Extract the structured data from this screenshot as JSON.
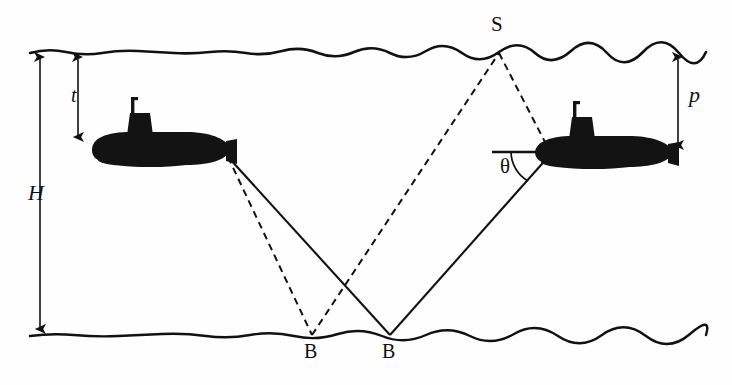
{
  "figure": {
    "domain": "physics-diagram",
    "background_color": "#fefefe",
    "ink_color": "#111111"
  },
  "labels": {
    "depth_total": "H",
    "depth_own_sub": "t",
    "depth_target_sub": "p",
    "surface_point": "S",
    "bottom_point_1": "B",
    "bottom_point_2": "B",
    "angle": "θ"
  },
  "boundaries": {
    "sea_surface": {
      "name": "sea-surface",
      "y": 52,
      "x_start": 30,
      "x_end": 706,
      "style": "wavy"
    },
    "sea_bottom": {
      "name": "sea-bottom",
      "y": 335,
      "x_start": 30,
      "x_end": 706,
      "style": "wavy"
    }
  },
  "dimension_arrows": [
    {
      "name": "H",
      "label": "H",
      "x": 40,
      "y_top": 52,
      "y_bottom": 333,
      "heads": "both",
      "label_x": 30,
      "label_y": 185
    },
    {
      "name": "t",
      "label": "t",
      "x": 78,
      "y_top": 52,
      "y_bottom": 141,
      "heads": "both",
      "label_x": 70,
      "label_y": 86
    },
    {
      "name": "p",
      "label": "p",
      "x": 678,
      "y_top": 52,
      "y_bottom": 149,
      "heads": "both",
      "label_x": 688,
      "label_y": 86
    }
  ],
  "nodes": {
    "S": {
      "label": "S",
      "x": 499,
      "y": 52,
      "label_x": 491,
      "label_y": 16
    },
    "B1": {
      "label": "B",
      "x": 312,
      "y": 335,
      "label_x": 304,
      "label_y": 341
    },
    "B2": {
      "label": "B",
      "x": 390,
      "y": 335,
      "label_x": 382,
      "label_y": 341
    }
  },
  "submarines": [
    {
      "name": "own-submarine",
      "side": "left",
      "facing": "right",
      "hull": {
        "x": 92,
        "y": 134,
        "width": 140,
        "height": 30
      },
      "tower": {
        "x": 127,
        "y": 111,
        "width": 26,
        "height": 26
      },
      "mast": {
        "x": 132,
        "y": 98,
        "height": 15
      },
      "depth_label": "t"
    },
    {
      "name": "target-submarine",
      "side": "right",
      "facing": "right",
      "hull": {
        "x": 535,
        "y": 138,
        "width": 140,
        "height": 29
      },
      "tower": {
        "x": 569,
        "y": 116,
        "width": 26,
        "height": 25
      },
      "mast": {
        "x": 574,
        "y": 103,
        "height": 15
      },
      "depth_label": "p"
    }
  ],
  "ray_paths": [
    {
      "name": "own-sub-to-B1-dashed",
      "style": "dashed",
      "from": [
        228,
        157
      ],
      "to": [
        312,
        335
      ]
    },
    {
      "name": "B1-to-S-dashed",
      "style": "dashed",
      "from": [
        312,
        335
      ],
      "to": [
        499,
        52
      ]
    },
    {
      "name": "S-to-target-dashed",
      "style": "dashed",
      "from": [
        499,
        52
      ],
      "to": [
        545,
        143
      ]
    },
    {
      "name": "own-sub-to-B2-solid",
      "style": "solid",
      "from": [
        228,
        159
      ],
      "to": [
        390,
        335
      ]
    },
    {
      "name": "B2-to-target-solid",
      "style": "solid",
      "from": [
        390,
        335
      ],
      "to": [
        548,
        155
      ]
    }
  ],
  "angle_marker": {
    "name": "theta-angle",
    "vertex": [
      545,
      152
    ],
    "baseline": {
      "from": [
        492,
        152
      ],
      "to": [
        545,
        152
      ],
      "style": "solid"
    },
    "arc_radius": 34,
    "label": "θ",
    "label_x": 501,
    "label_y": 158
  }
}
